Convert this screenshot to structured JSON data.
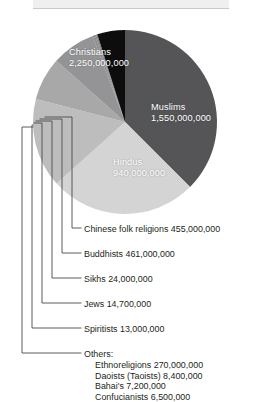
{
  "figure": {
    "top_band_present": true
  },
  "pie_labels": [
    {
      "name": "Christians",
      "value": "2,250,000,000"
    },
    {
      "name": "Muslims",
      "value": "1,550,000,000"
    },
    {
      "name": "Hindus",
      "value": "940,000,000"
    }
  ],
  "callouts": [
    {
      "text": "Chinese folk religions 455,000,000"
    },
    {
      "text": "Buddhists 461,000,000"
    },
    {
      "text": "Sikhs 24,000,000"
    },
    {
      "text": "Jews 14,700,000"
    },
    {
      "text": "Spiritists 13,000,000"
    },
    {
      "text": "Others:"
    }
  ],
  "others_detail": [
    {
      "text": "Ethnoreligions 270,000,000"
    },
    {
      "text": "Daoists (Taoists) 8,400,000"
    },
    {
      "text": "Bahai's 7,200,000"
    },
    {
      "text": "Confucianists 6,500,000"
    }
  ],
  "colors": {
    "christians": "#555557",
    "muslims": "#d4d4d4",
    "hindus": "#bdbdbd",
    "chinese_folk": "#a8a8a8",
    "buddhists": "#949496",
    "sikhs": "#8d8d8f",
    "jews": "#868688",
    "spiritists": "#7f7f81",
    "others": "#0d0d0d",
    "label_text": "#ffffff",
    "body_text": "#231f20",
    "leader_line": "#4a4a4a",
    "top_band": "#efefef"
  },
  "chart_data": {
    "type": "pie",
    "title": "",
    "legend_position": "callout-lines-left",
    "unit": "adherents",
    "total": 5270000000,
    "categories": [
      "Christians",
      "Muslims",
      "Hindus",
      "Chinese folk religions",
      "Buddhists",
      "Sikhs",
      "Jews",
      "Spiritists",
      "Others"
    ],
    "values": [
      2250000000,
      1550000000,
      940000000,
      455000000,
      461000000,
      24000000,
      14700000,
      13000000,
      292100000
    ],
    "value_labels": [
      "2,250,000,000",
      "1,550,000,000",
      "940,000,000",
      "455,000,000",
      "461,000,000",
      "24,000,000",
      "14,700,000",
      "13,000,000",
      ""
    ],
    "slice_colors": [
      "#555557",
      "#d4d4d4",
      "#bdbdbd",
      "#a8a8a8",
      "#949496",
      "#8d8d8f",
      "#868688",
      "#7f7f81",
      "#0d0d0d"
    ],
    "labels_inside_slice": [
      "Christians",
      "Muslims",
      "Hindus"
    ],
    "labels_via_leader_line": [
      "Chinese folk religions",
      "Buddhists",
      "Sikhs",
      "Jews",
      "Spiritists",
      "Others"
    ],
    "others_breakdown": {
      "categories": [
        "Ethnoreligions",
        "Daoists (Taoists)",
        "Bahai's",
        "Confucianists"
      ],
      "values": [
        270000000,
        8400000,
        7200000,
        6500000
      ],
      "value_labels": [
        "270,000,000",
        "8,400,000",
        "7,200,000",
        "6,500,000"
      ]
    }
  }
}
